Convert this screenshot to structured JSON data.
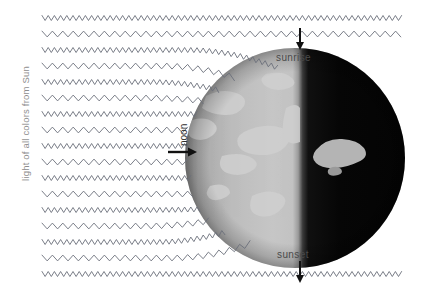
{
  "diagram": {
    "background_color": "#ffffff"
  },
  "labels": {
    "light_source": "light of all colors from Sun",
    "noon": "noon",
    "sunrise": "sunrise",
    "sunset": "sunset"
  },
  "colors": {
    "wave_stroke": "#6b6f7a",
    "side_label": "#8e8e8e",
    "label_dark": "#2e2e2e",
    "label_mid": "#4a4a4a",
    "arrow": "#111111",
    "earth_lit": "#b8b8b8",
    "earth_lit_highlight": "#d2d2d2",
    "earth_land_lit": "#cdcdcd",
    "earth_dark": "#070707",
    "earth_land_dark": "#b0b0b0",
    "glow": "#ffffff"
  },
  "earth": {
    "center_x": 295,
    "center_y": 158,
    "radius": 110,
    "terminator_x": 300,
    "lit_side": "left",
    "dark_side": "right"
  },
  "rays": {
    "count": 17,
    "start_x": 42,
    "first_y": 18,
    "spacing": 16,
    "styles": [
      "zigzag",
      "smooth"
    ],
    "description": "alternating high-frequency zigzag and lower-frequency smooth wavy lines travelling left to right"
  },
  "markers": [
    {
      "name": "sunrise-arrow",
      "x": 300,
      "y_from": 28,
      "y_to": 48,
      "direction": "down"
    },
    {
      "name": "noon-arrow",
      "x_from": 168,
      "x_to": 196,
      "y": 152,
      "direction": "right"
    },
    {
      "name": "sunset-arrow",
      "x": 300,
      "y_from": 262,
      "y_to": 282,
      "direction": "down"
    }
  ]
}
